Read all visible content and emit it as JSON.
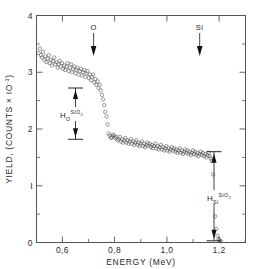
{
  "figure": {
    "background": "#ffffff",
    "frame_color": "#555555",
    "marker_color": "#4a4a4a",
    "annotation_color": "#111111"
  },
  "chart_data": {
    "type": "scatter",
    "title": "",
    "xlabel": "ENERGY  (MeV)",
    "ylabel": "YIELD, (COUNTS  × IO⁻³)",
    "ylabel_parts": {
      "main": "YIELD, (COUNTS  × IO",
      "exponent": "-3",
      "close": ")"
    },
    "xlim": [
      0.47,
      1.27
    ],
    "ylim": [
      0,
      4
    ],
    "xticks": [
      0.6,
      0.8,
      1.0,
      1.2
    ],
    "xtick_labels": [
      "0,6",
      "0,8",
      "1,0",
      "1,2"
    ],
    "xticks_minor": [
      0.5,
      0.7,
      0.9,
      1.1
    ],
    "yticks": [
      0,
      1,
      2,
      3,
      4
    ],
    "ytick_labels": [
      "0",
      "I",
      "2",
      "3",
      "4"
    ],
    "yticks_minor": [
      0.5,
      1.5,
      2.5,
      3.5
    ],
    "grid": false,
    "legend": "none",
    "marker": "open-circle",
    "marker_size_px": 1.7,
    "series": [
      {
        "name": "RBS spectrum",
        "x": [
          0.478,
          0.483,
          0.487,
          0.491,
          0.495,
          0.5,
          0.504,
          0.508,
          0.512,
          0.517,
          0.521,
          0.525,
          0.529,
          0.534,
          0.538,
          0.542,
          0.546,
          0.551,
          0.555,
          0.559,
          0.563,
          0.568,
          0.572,
          0.576,
          0.58,
          0.585,
          0.589,
          0.593,
          0.597,
          0.602,
          0.606,
          0.61,
          0.614,
          0.619,
          0.623,
          0.627,
          0.631,
          0.636,
          0.64,
          0.644,
          0.648,
          0.653,
          0.657,
          0.661,
          0.665,
          0.67,
          0.674,
          0.678,
          0.682,
          0.687,
          0.691,
          0.695,
          0.699,
          0.704,
          0.708,
          0.712,
          0.716,
          0.721,
          0.725,
          0.729,
          0.733,
          0.738,
          0.742,
          0.746,
          0.75,
          0.755,
          0.759,
          0.763,
          0.767,
          0.772,
          0.776,
          0.78,
          0.784,
          0.789,
          0.793,
          0.797,
          0.801,
          0.806,
          0.81,
          0.814,
          0.818,
          0.823,
          0.827,
          0.831,
          0.835,
          0.84,
          0.844,
          0.848,
          0.852,
          0.857,
          0.861,
          0.865,
          0.869,
          0.874,
          0.878,
          0.882,
          0.886,
          0.891,
          0.895,
          0.899,
          0.903,
          0.908,
          0.912,
          0.916,
          0.92,
          0.925,
          0.929,
          0.933,
          0.937,
          0.942,
          0.946,
          0.95,
          0.954,
          0.959,
          0.963,
          0.967,
          0.971,
          0.976,
          0.98,
          0.984,
          0.988,
          0.993,
          0.997,
          1.001,
          1.005,
          1.01,
          1.014,
          1.018,
          1.022,
          1.027,
          1.031,
          1.035,
          1.039,
          1.044,
          1.048,
          1.052,
          1.056,
          1.061,
          1.065,
          1.069,
          1.073,
          1.078,
          1.082,
          1.086,
          1.09,
          1.095,
          1.099,
          1.103,
          1.107,
          1.112,
          1.116,
          1.12,
          1.124,
          1.129,
          1.133,
          1.137,
          1.141,
          1.146,
          1.15,
          1.154,
          1.158,
          1.163,
          1.167,
          1.171,
          1.176
        ],
        "y": [
          3.34,
          3.42,
          3.3,
          3.26,
          3.36,
          3.22,
          3.28,
          3.18,
          3.24,
          3.3,
          3.16,
          3.22,
          3.12,
          3.2,
          3.26,
          3.14,
          3.18,
          3.08,
          3.14,
          3.2,
          3.1,
          3.16,
          3.06,
          3.12,
          3.04,
          3.1,
          3.16,
          3.02,
          3.08,
          3.14,
          3.0,
          3.06,
          3.1,
          2.98,
          3.04,
          3.08,
          2.96,
          3.02,
          3.06,
          2.94,
          3.0,
          3.04,
          2.92,
          2.98,
          3.02,
          2.9,
          2.96,
          2.86,
          2.92,
          2.96,
          2.82,
          2.88,
          2.78,
          2.84,
          2.72,
          2.78,
          2.68,
          2.6,
          2.52,
          2.42,
          2.3,
          2.22,
          2.08,
          1.92,
          1.88,
          1.84,
          1.86,
          1.9,
          1.88,
          1.84,
          1.86,
          1.8,
          1.82,
          1.86,
          1.78,
          1.82,
          1.76,
          1.8,
          1.84,
          1.76,
          1.8,
          1.74,
          1.78,
          1.82,
          1.74,
          1.78,
          1.72,
          1.76,
          1.8,
          1.72,
          1.76,
          1.7,
          1.74,
          1.78,
          1.7,
          1.74,
          1.68,
          1.72,
          1.76,
          1.7,
          1.74,
          1.68,
          1.72,
          1.66,
          1.7,
          1.74,
          1.66,
          1.7,
          1.64,
          1.68,
          1.72,
          1.64,
          1.68,
          1.62,
          1.66,
          1.7,
          1.62,
          1.66,
          1.6,
          1.64,
          1.68,
          1.62,
          1.66,
          1.6,
          1.64,
          1.58,
          1.62,
          1.66,
          1.58,
          1.62,
          1.56,
          1.6,
          1.64,
          1.58,
          1.62,
          1.56,
          1.6,
          1.54,
          1.58,
          1.62,
          1.56,
          1.6,
          1.54,
          1.58,
          1.52,
          1.56,
          1.6,
          1.54,
          1.58,
          1.52,
          1.56,
          1.5,
          1.54,
          1.58,
          1.52,
          1.48,
          1.44,
          1.2,
          0.78,
          0.46,
          0.24,
          0.12,
          0.06,
          0.04,
          0.02
        ]
      }
    ],
    "annotations": [
      {
        "id": "oxygen-edge",
        "label": "O",
        "type": "down-arrow",
        "x": 0.722,
        "y_top": 3.78,
        "y_bottom": 3.38
      },
      {
        "id": "silicon-edge",
        "label": "Si",
        "type": "down-arrow",
        "x": 1.128,
        "y_top": 3.78,
        "y_bottom": 3.38
      },
      {
        "id": "height-oxygen",
        "label_base": "H",
        "label_sub": "O",
        "label_sup": "SiO",
        "label_sup_sub": "2",
        "type": "double-arrow-vertical",
        "x": 0.655,
        "y_high": 2.72,
        "y_low": 1.82
      },
      {
        "id": "height-silicon",
        "label_base": "H",
        "label_sub": "Si",
        "label_sup": "SiO",
        "label_sup_sub": "2",
        "type": "double-arrow-vertical",
        "x": 1.178,
        "y_high": 1.6,
        "y_low": 0.03
      }
    ]
  }
}
